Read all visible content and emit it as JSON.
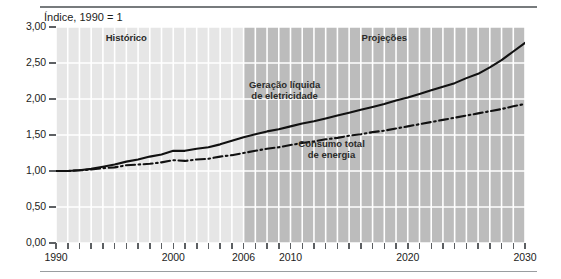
{
  "figure": {
    "title": "Índice, 1990 = 1",
    "band_labels": [
      {
        "name": "historico",
        "text": "Histórico"
      },
      {
        "name": "projecoes",
        "text": "Projeções"
      }
    ],
    "series_labels": [
      {
        "name": "geracao-liquida-de-eletricidade",
        "line1": "Geração líquida",
        "line2": "de eletricidade"
      },
      {
        "name": "consumo-total-de-energia",
        "line1": "Consumo total",
        "line2": "de energia"
      }
    ],
    "colors": {
      "plot_background_historic": "#e6e6e6",
      "plot_background_projection": "#bcbcbc",
      "gridline": "#ffffff",
      "line": "#111111",
      "text": "#1d1d1b",
      "rule": "#777b7d"
    }
  },
  "chart_data": {
    "type": "line",
    "title": "Índice, 1990 = 1",
    "xlabel": "",
    "ylabel": "Índice, 1990 = 1",
    "xlim": [
      1990,
      2030
    ],
    "ylim": [
      0.0,
      3.0
    ],
    "yticks": [
      0.0,
      0.5,
      1.0,
      1.5,
      2.0,
      2.5,
      3.0
    ],
    "ytick_labels": [
      "0,00",
      "0,50",
      "1,00",
      "1,50",
      "2,00",
      "2,50",
      "3,00"
    ],
    "xticks": [
      1990,
      1991,
      1992,
      1993,
      1994,
      1995,
      1996,
      1997,
      1998,
      1999,
      2000,
      2001,
      2002,
      2003,
      2004,
      2005,
      2006,
      2007,
      2008,
      2009,
      2010,
      2011,
      2012,
      2013,
      2014,
      2015,
      2016,
      2017,
      2018,
      2019,
      2020,
      2021,
      2022,
      2023,
      2024,
      2025,
      2026,
      2027,
      2028,
      2029,
      2030
    ],
    "xtick_labels_shown": [
      {
        "x": 1990,
        "label": "1990"
      },
      {
        "x": 2000,
        "label": "2000"
      },
      {
        "x": 2006,
        "label": "2006"
      },
      {
        "x": 2010,
        "label": "2010"
      },
      {
        "x": 2020,
        "label": "2020"
      },
      {
        "x": 2030,
        "label": "2030"
      }
    ],
    "grid": {
      "x": true,
      "y": true,
      "color": "#ffffff"
    },
    "legend_position": "inline-annotations",
    "regions": [
      {
        "name": "Histórico",
        "x_start": 1990,
        "x_end": 2006,
        "shade": "#e6e6e6"
      },
      {
        "name": "Projeções",
        "x_start": 2006,
        "x_end": 2030,
        "shade": "#bcbcbc"
      }
    ],
    "annotations": [
      {
        "text": "Histórico",
        "x": 1996,
        "y": 2.85
      },
      {
        "text": "Projeções",
        "x": 2018,
        "y": 2.85
      },
      {
        "text": "Geração líquida de eletricidade",
        "x": 2009.5,
        "y": 2.12
      },
      {
        "text": "Consumo total de energia",
        "x": 2013.5,
        "y": 1.3
      }
    ],
    "series": [
      {
        "name": "Geração líquida de eletricidade",
        "style": "solid",
        "x": [
          1990,
          1991,
          1992,
          1993,
          1994,
          1995,
          1996,
          1997,
          1998,
          1999,
          2000,
          2001,
          2002,
          2003,
          2004,
          2005,
          2006,
          2007,
          2008,
          2009,
          2010,
          2011,
          2012,
          2013,
          2014,
          2015,
          2016,
          2017,
          2018,
          2019,
          2020,
          2021,
          2022,
          2023,
          2024,
          2025,
          2026,
          2027,
          2028,
          2029,
          2030
        ],
        "values": [
          1.0,
          1.0,
          1.01,
          1.03,
          1.06,
          1.09,
          1.13,
          1.16,
          1.2,
          1.23,
          1.28,
          1.28,
          1.31,
          1.33,
          1.37,
          1.42,
          1.47,
          1.51,
          1.55,
          1.58,
          1.62,
          1.66,
          1.69,
          1.73,
          1.77,
          1.81,
          1.85,
          1.89,
          1.93,
          1.98,
          2.02,
          2.07,
          2.12,
          2.17,
          2.22,
          2.29,
          2.35,
          2.44,
          2.54,
          2.66,
          2.78
        ]
      },
      {
        "name": "Consumo total de energia",
        "style": "dash-dot",
        "x": [
          1990,
          1991,
          1992,
          1993,
          1994,
          1995,
          1996,
          1997,
          1998,
          1999,
          2000,
          2001,
          2002,
          2003,
          2004,
          2005,
          2006,
          2007,
          2008,
          2009,
          2010,
          2011,
          2012,
          2013,
          2014,
          2015,
          2016,
          2017,
          2018,
          2019,
          2020,
          2021,
          2022,
          2023,
          2024,
          2025,
          2026,
          2027,
          2028,
          2029,
          2030
        ],
        "values": [
          1.0,
          1.0,
          1.01,
          1.02,
          1.04,
          1.05,
          1.08,
          1.09,
          1.1,
          1.12,
          1.15,
          1.14,
          1.16,
          1.17,
          1.2,
          1.22,
          1.25,
          1.28,
          1.31,
          1.33,
          1.36,
          1.39,
          1.41,
          1.44,
          1.46,
          1.49,
          1.51,
          1.54,
          1.56,
          1.59,
          1.62,
          1.65,
          1.68,
          1.71,
          1.74,
          1.77,
          1.8,
          1.83,
          1.86,
          1.9,
          1.93
        ]
      }
    ]
  }
}
